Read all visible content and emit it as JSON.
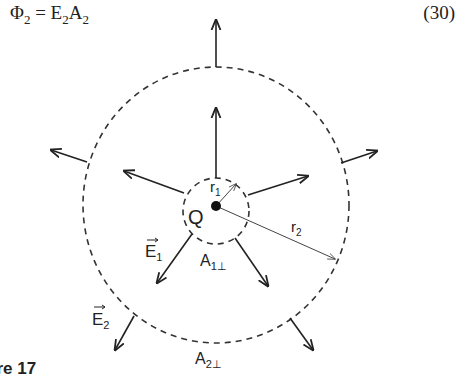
{
  "equation": {
    "phi": "Φ",
    "phi_sub": "2",
    "equals": " = ",
    "e": "E",
    "e_sub": "2",
    "a": "A",
    "a_sub": "2",
    "number": "(30)"
  },
  "diagram": {
    "charge_label": "Q",
    "r1_label": "r",
    "r1_sub": "1",
    "r2_label": "r",
    "r2_sub": "2",
    "e1_label": "E",
    "e1_sub": "1",
    "e2_label": "E",
    "e2_sub": "2",
    "a1_label": "A",
    "a1_sub": "1⊥",
    "a2_label": "A",
    "a2_sub": "2⊥"
  },
  "caption": "ure 17"
}
